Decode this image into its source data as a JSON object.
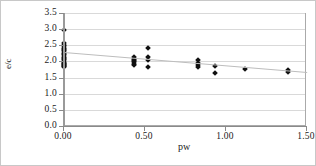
{
  "chart_data": {
    "type": "scatter",
    "title": "",
    "xlabel": "pw",
    "ylabel": "e/c",
    "xlim": [
      0.0,
      1.5
    ],
    "ylim": [
      0.0,
      3.5
    ],
    "xticks": [
      0.0,
      0.5,
      1.0,
      1.5
    ],
    "xticklabels": [
      "0.00",
      "0.50",
      "1.00",
      "1.50"
    ],
    "yticks": [
      0.0,
      0.5,
      1.0,
      1.5,
      2.0,
      2.5,
      3.0,
      3.5
    ],
    "yticklabels": [
      "0.0",
      "0.5",
      "1.0",
      "1.5",
      "2.0",
      "2.5",
      "3.0",
      "3.5"
    ],
    "grid": "horizontal",
    "legend": "none",
    "marker": "diamond",
    "marker_color": "#101010",
    "series": [
      {
        "name": "e/c vs pw",
        "points": [
          [
            0.0,
            3.0
          ],
          [
            0.0,
            2.6
          ],
          [
            0.0,
            2.55
          ],
          [
            0.0,
            2.5
          ],
          [
            0.0,
            2.46
          ],
          [
            0.0,
            2.42
          ],
          [
            0.0,
            2.38
          ],
          [
            0.0,
            2.34
          ],
          [
            0.0,
            2.3
          ],
          [
            0.0,
            2.26
          ],
          [
            0.0,
            2.22
          ],
          [
            0.0,
            2.18
          ],
          [
            0.0,
            2.14
          ],
          [
            0.0,
            2.1
          ],
          [
            0.0,
            2.06
          ],
          [
            0.0,
            2.02
          ],
          [
            0.0,
            1.98
          ],
          [
            0.0,
            1.96
          ],
          [
            0.0,
            1.94
          ],
          [
            0.0,
            1.92
          ],
          [
            0.0,
            1.9
          ],
          [
            0.0,
            1.88
          ],
          [
            0.0,
            1.86
          ],
          [
            0.43,
            2.18
          ],
          [
            0.43,
            2.12
          ],
          [
            0.43,
            2.08
          ],
          [
            0.43,
            2.04
          ],
          [
            0.43,
            2.0
          ],
          [
            0.43,
            1.96
          ],
          [
            0.43,
            1.92
          ],
          [
            0.52,
            2.45
          ],
          [
            0.52,
            2.18
          ],
          [
            0.52,
            2.06
          ],
          [
            0.52,
            1.86
          ],
          [
            0.83,
            2.08
          ],
          [
            0.83,
            1.98
          ],
          [
            0.83,
            1.92
          ],
          [
            0.83,
            1.86
          ],
          [
            0.93,
            1.9
          ],
          [
            0.93,
            1.68
          ],
          [
            1.12,
            1.8
          ],
          [
            1.38,
            1.78
          ],
          [
            1.38,
            1.7
          ]
        ]
      }
    ],
    "trendline": {
      "type": "linear",
      "x_start": 0.0,
      "y_start": 2.32,
      "x_end": 1.5,
      "y_end": 1.7,
      "color": "#bdbdbd"
    }
  }
}
